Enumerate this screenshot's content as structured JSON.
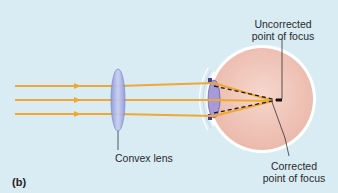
{
  "figure": {
    "panel_label": "(b)",
    "background_color": "#d9ecf4",
    "ray_color": "#f0a830",
    "lens_color": "#a9b3e6",
    "eye_color": "#f3c9bd",
    "labels": {
      "uncorrected_line1": "Uncorrected",
      "uncorrected_line2": "point of focus",
      "convex_lens": "Convex lens",
      "corrected_line1": "Corrected",
      "corrected_line2": "point of focus"
    }
  }
}
